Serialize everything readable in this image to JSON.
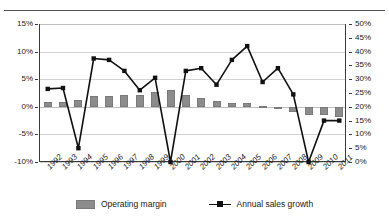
{
  "title_fragment": "",
  "legend": {
    "bar_label": "Operating margin",
    "line_label": "Annual sales growth"
  },
  "axes": {
    "left_ticks": [
      "15%",
      "10%",
      "5%",
      "0%",
      "-5%",
      "-10%"
    ],
    "right_ticks": [
      "50%",
      "45%",
      "40%",
      "35%",
      "30%",
      "25%",
      "20%",
      "15%",
      "10%",
      "5%",
      "0%"
    ]
  },
  "chart_data": {
    "type": "bar",
    "title": "",
    "subtitle": "",
    "xlabel": "",
    "ylabel": "",
    "grid": true,
    "legend_position": "bottom",
    "categories": [
      "1992",
      "1993",
      "1994",
      "1995",
      "1996",
      "1997",
      "1998",
      "1999",
      "2000",
      "2001",
      "2002",
      "2003",
      "2004",
      "2005",
      "2006",
      "2007",
      "2008",
      "2009",
      "2010",
      "2011"
    ],
    "series": [
      {
        "name": "Operating margin",
        "type": "bar",
        "axis": "left",
        "unit": "%",
        "color": "#8c8c8c",
        "ylim": [
          -10,
          15
        ],
        "ytick_step": 5,
        "values": [
          0.8,
          0.8,
          1.2,
          1.9,
          1.9,
          2.2,
          2.1,
          2.6,
          3.0,
          2.1,
          1.6,
          1.1,
          0.7,
          0.7,
          0.2,
          -0.4,
          -1.0,
          -1.5,
          -1.5,
          -1.8
        ]
      },
      {
        "name": "Annual sales growth",
        "type": "line",
        "axis": "right",
        "unit": "%",
        "color": "#111111",
        "marker": "square",
        "ylim": [
          0,
          50
        ],
        "ytick_step": 5,
        "values": [
          26.5,
          26.8,
          5.0,
          37.5,
          37.0,
          33.0,
          26.0,
          30.5,
          0.0,
          33.0,
          34.0,
          28.0,
          37.0,
          42.0,
          29.0,
          34.0,
          24.5,
          0.0,
          15.0,
          15.0
        ]
      }
    ]
  }
}
